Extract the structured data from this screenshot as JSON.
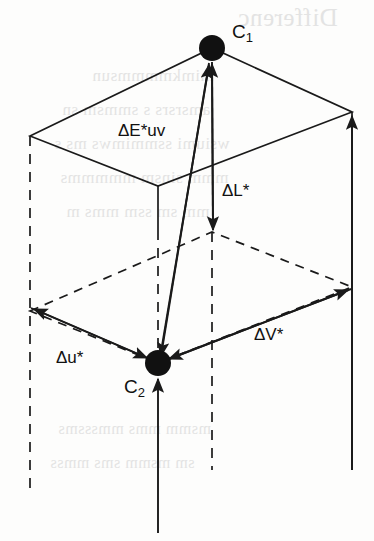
{
  "figure": {
    "kind": "cielab-cieluv-color-difference-vector-diagram",
    "background_color": "#fdfdfc",
    "stroke_color": "#1a1a1a",
    "ghost_color": "#cfcfcf"
  },
  "points": [
    {
      "id": "c1",
      "label": "C",
      "sub": "1",
      "x": 212,
      "y": 48,
      "radius": 13
    },
    {
      "id": "c2",
      "label": "C",
      "sub": "2",
      "x": 158,
      "y": 363,
      "radius": 13
    }
  ],
  "vectors": [
    {
      "id": "delta-e-uv",
      "label": "ΔE*uv",
      "label_x": 118,
      "label_y": 122
    },
    {
      "id": "delta-l-star",
      "label": "ΔL*",
      "label_x": 222,
      "label_y": 182
    },
    {
      "id": "delta-u-star",
      "label": "Δu*",
      "label_x": 56,
      "label_y": 349
    },
    {
      "id": "delta-v-star",
      "label": "ΔV*",
      "label_x": 254,
      "label_y": 326
    }
  ],
  "geometry": {
    "top_face": [
      [
        30,
        136
      ],
      [
        212,
        48
      ],
      [
        352,
        112
      ],
      [
        158,
        186
      ]
    ],
    "bottom_face": [
      [
        30,
        311
      ],
      [
        212,
        232
      ],
      [
        352,
        287
      ],
      [
        158,
        363
      ]
    ],
    "verticals": [
      {
        "x": 30,
        "y1": 136,
        "y2": 490,
        "style": "dashed"
      },
      {
        "x": 158,
        "y1": 186,
        "y2": 533,
        "style": "solid-partial"
      },
      {
        "x": 212,
        "y1": 232,
        "y2": 470,
        "style": "dashed"
      },
      {
        "x": 352,
        "y1": 112,
        "y2": 470,
        "style": "solid"
      }
    ]
  },
  "ghost_text": {
    "note": "faint mirrored show-through from the reverse side of the printed page",
    "lines": [
      {
        "text": "Differenc",
        "x": 238,
        "y": 18,
        "size": 25
      },
      {
        "text": "mimkmmmmsun",
        "x": 92,
        "y": 78,
        "size": 17
      },
      {
        "text": "amsrsrs s smmsm sn",
        "x": 62,
        "y": 112,
        "size": 17
      },
      {
        "text": "wsiumi ssmmimws ms s",
        "x": 54,
        "y": 146,
        "size": 17
      },
      {
        "text": "mmm sinsm mmmmms",
        "x": 60,
        "y": 180,
        "size": 17
      },
      {
        "text": "mm sm ssm mms m",
        "x": 66,
        "y": 214,
        "size": 17
      },
      {
        "text": "msmm mms mmsssms",
        "x": 58,
        "y": 432,
        "size": 16
      },
      {
        "text": "sm  msmm  sms   mmss",
        "x": 50,
        "y": 466,
        "size": 16
      }
    ]
  }
}
